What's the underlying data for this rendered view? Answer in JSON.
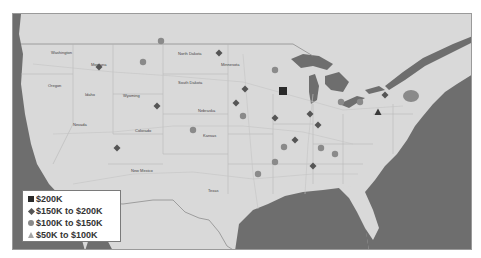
{
  "map": {
    "region": "United States",
    "colors": {
      "land": "#d9d9d9",
      "water": "#6e6e6e",
      "border": "#9a9a9a",
      "marker_dark": "#2a2a2a",
      "marker_mid": "#555555",
      "marker_light": "#8a8a8a",
      "marker_lighter": "#a5a5a5"
    },
    "state_labels": [
      {
        "name": "Washington",
        "x": 38,
        "y": 40
      },
      {
        "name": "Montana",
        "x": 78,
        "y": 52
      },
      {
        "name": "North Dakota",
        "x": 165,
        "y": 41
      },
      {
        "name": "South Dakota",
        "x": 165,
        "y": 70
      },
      {
        "name": "Minnesota",
        "x": 208,
        "y": 52
      },
      {
        "name": "Oregon",
        "x": 35,
        "y": 73
      },
      {
        "name": "Idaho",
        "x": 72,
        "y": 82
      },
      {
        "name": "Wyoming",
        "x": 110,
        "y": 83
      },
      {
        "name": "Nebraska",
        "x": 185,
        "y": 98
      },
      {
        "name": "Nevada",
        "x": 60,
        "y": 112
      },
      {
        "name": "Colorado",
        "x": 122,
        "y": 118
      },
      {
        "name": "Kansas",
        "x": 190,
        "y": 123
      },
      {
        "name": "New Mexico",
        "x": 118,
        "y": 158
      },
      {
        "name": "Texas",
        "x": 195,
        "y": 178
      }
    ],
    "markers": [
      {
        "type": "diamond",
        "x": 86,
        "y": 53
      },
      {
        "type": "circle",
        "x": 148,
        "y": 27
      },
      {
        "type": "circle",
        "x": 130,
        "y": 48
      },
      {
        "type": "diamond",
        "x": 144,
        "y": 92
      },
      {
        "type": "diamond",
        "x": 104,
        "y": 134
      },
      {
        "type": "circle",
        "x": 180,
        "y": 116
      },
      {
        "type": "circle",
        "x": 230,
        "y": 102
      },
      {
        "type": "diamond",
        "x": 223,
        "y": 89
      },
      {
        "type": "square",
        "x": 270,
        "y": 77
      },
      {
        "type": "diamond",
        "x": 206,
        "y": 39
      },
      {
        "type": "diamond",
        "x": 232,
        "y": 75
      },
      {
        "type": "diamond",
        "x": 262,
        "y": 104
      },
      {
        "type": "diamond",
        "x": 297,
        "y": 100
      },
      {
        "type": "diamond",
        "x": 282,
        "y": 126
      },
      {
        "type": "circle",
        "x": 271,
        "y": 133
      },
      {
        "type": "circle",
        "x": 308,
        "y": 134
      },
      {
        "type": "circle",
        "x": 262,
        "y": 56
      },
      {
        "type": "circle",
        "x": 328,
        "y": 88
      },
      {
        "type": "circle",
        "x": 347,
        "y": 88
      },
      {
        "type": "diamond",
        "x": 372,
        "y": 81
      },
      {
        "type": "diamond",
        "x": 300,
        "y": 152
      },
      {
        "type": "circle",
        "x": 322,
        "y": 140
      },
      {
        "type": "triangle",
        "x": 365,
        "y": 98
      },
      {
        "type": "circle",
        "x": 262,
        "y": 148
      },
      {
        "type": "diamond",
        "x": 305,
        "y": 111
      },
      {
        "type": "circle",
        "x": 245,
        "y": 160
      }
    ]
  },
  "legend": {
    "items": [
      {
        "symbol": "square",
        "label": "$200K"
      },
      {
        "symbol": "diamond",
        "label": "$150K to $200K"
      },
      {
        "symbol": "circle",
        "label": "$100K to $150K"
      },
      {
        "symbol": "triangle",
        "label": "$50K to $100K"
      }
    ]
  }
}
